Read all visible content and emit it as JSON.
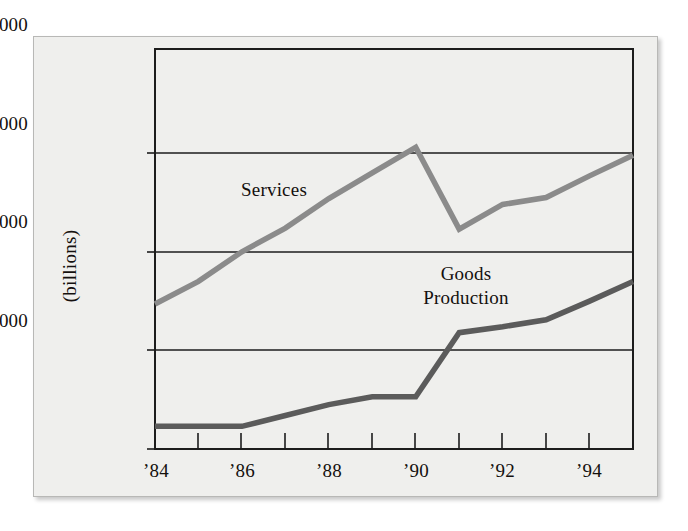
{
  "chart_data": {
    "type": "line",
    "title": "",
    "xlabel": "",
    "ylabel": "(billions)",
    "x": [
      1984,
      1985,
      1986,
      1987,
      1988,
      1989,
      1990,
      1991,
      1992,
      1993,
      1994,
      1995
    ],
    "xtick_labels": [
      "’84",
      "’86",
      "’88",
      "’90",
      "’92",
      "’94"
    ],
    "xtick_values": [
      1984,
      1986,
      1988,
      1990,
      1992,
      1994
    ],
    "ytick_labels": [
      "$4,000",
      "$3,000",
      "$2,000",
      "$1,000"
    ],
    "ytick_values": [
      4000,
      3000,
      2000,
      1000
    ],
    "ylim": [
      1000,
      5040
    ],
    "xlim": [
      1984,
      1995
    ],
    "grid": true,
    "legend_position": "inline-annotations",
    "series": [
      {
        "name": "Services",
        "color": "#8b8b8b",
        "label_text": "Services",
        "values": [
          2470,
          2700,
          3000,
          3240,
          3540,
          3800,
          4060,
          3230,
          3480,
          3550,
          3770,
          3980
        ]
      },
      {
        "name": "Goods Production",
        "color": "#5b5b5b",
        "label_line1": "Goods",
        "label_line2": "Production",
        "values": [
          1230,
          1230,
          1230,
          1340,
          1450,
          1530,
          1530,
          2180,
          2240,
          2310,
          2500,
          2700
        ]
      }
    ],
    "annotations": [
      {
        "text": "Services",
        "x": 1986.6,
        "y": 3560
      },
      {
        "text": "Goods Production",
        "x": 1991.1,
        "y": 2880
      }
    ],
    "colors": {
      "figure_background": "#efefed",
      "plot_background": "#efefed",
      "axis": "#1c1c1c",
      "gridline": "#1c1c1c",
      "text": "#14100e",
      "services_line": "#8b8b8b",
      "goods_line": "#5b5b5b"
    }
  },
  "axis": {
    "y_title": "(billions)",
    "y_ticks": [
      {
        "label": "$4,000"
      },
      {
        "label": "$3,000"
      },
      {
        "label": "$2,000"
      },
      {
        "label": "$1,000"
      }
    ],
    "x_ticks": [
      {
        "label": "’84"
      },
      {
        "label": "’86"
      },
      {
        "label": "’88"
      },
      {
        "label": "’90"
      },
      {
        "label": "’92"
      },
      {
        "label": "’94"
      }
    ]
  },
  "annotations": {
    "services": "Services",
    "goods_line1": "Goods",
    "goods_line2": "Production"
  }
}
